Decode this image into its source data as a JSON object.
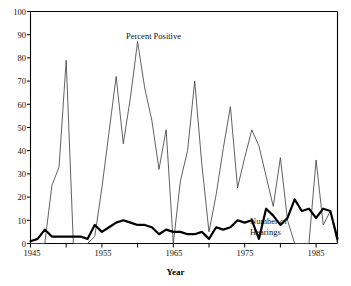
{
  "chart_data": {
    "type": "line",
    "title": "",
    "xlabel": "Year",
    "ylabel": "",
    "xlim": [
      1945,
      1988
    ],
    "ylim": [
      0,
      100
    ],
    "grid": false,
    "legend_position": "inline-annotations",
    "x_ticks_major": [
      1945,
      1955,
      1965,
      1975,
      1985
    ],
    "x_ticks_minor": [
      1950,
      1960,
      1970,
      1980
    ],
    "y_ticks": [
      0,
      10,
      20,
      30,
      40,
      50,
      60,
      70,
      80,
      90,
      100
    ],
    "annotations": [
      {
        "text": "Percent Positive",
        "x": 1959,
        "y": 88
      },
      {
        "text": "Number of",
        "x": 1979,
        "y": 8
      },
      {
        "text": "Hearings",
        "x": 1979,
        "y": 3
      }
    ],
    "x": [
      1945,
      1946,
      1947,
      1948,
      1949,
      1950,
      1951,
      1952,
      1953,
      1954,
      1955,
      1956,
      1957,
      1958,
      1959,
      1960,
      1961,
      1962,
      1963,
      1964,
      1965,
      1966,
      1967,
      1968,
      1969,
      1970,
      1971,
      1972,
      1973,
      1974,
      1975,
      1976,
      1977,
      1978,
      1979,
      1980,
      1981,
      1982,
      1983,
      1984,
      1985,
      1986,
      1987,
      1988
    ],
    "series": [
      {
        "name": "Percent Positive",
        "style": "thin",
        "color": "#444444",
        "values": [
          0,
          0,
          0,
          25,
          33,
          79,
          0,
          0,
          0,
          3,
          24,
          48,
          72,
          43,
          63,
          87,
          67,
          53,
          32,
          49,
          0,
          27,
          40,
          70,
          34,
          5,
          21,
          41,
          59,
          24,
          37,
          49,
          42,
          29,
          16,
          37,
          10,
          0,
          0,
          0,
          36,
          8,
          14,
          0
        ]
      },
      {
        "name": "Number of Hearings",
        "style": "thick",
        "color": "#000000",
        "values": [
          1,
          2,
          6,
          3,
          3,
          3,
          3,
          3,
          2,
          8,
          5,
          7,
          9,
          10,
          9,
          8,
          8,
          7,
          4,
          6,
          5,
          5,
          4,
          4,
          5,
          2,
          7,
          6,
          7,
          10,
          9,
          10,
          2,
          15,
          12,
          8,
          11,
          19,
          14,
          15,
          11,
          15,
          14,
          2
        ]
      }
    ]
  },
  "axes": {
    "y_tick_labels": [
      "0",
      "10",
      "20",
      "30",
      "40",
      "50",
      "60",
      "70",
      "80",
      "90",
      "100"
    ],
    "x_tick_labels": [
      "1945",
      "1955",
      "1965",
      "1975",
      "1985"
    ],
    "x_axis_title": "Year"
  },
  "labels": {
    "percent_positive": "Percent Positive",
    "number_of_line1": "Number of",
    "number_of_line2": "Hearings"
  }
}
